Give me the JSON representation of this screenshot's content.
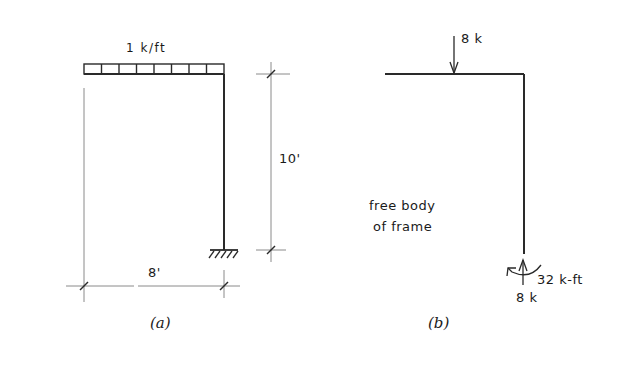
{
  "figure_a": {
    "caption": "(a)",
    "distributed_load_label": "1 k/ft",
    "height_dimension_label": "10'",
    "span_dimension_label": "8'",
    "support": "fixed",
    "load_segments": 8
  },
  "figure_b": {
    "caption": "(b)",
    "title_line1": "free body",
    "title_line2": "of frame",
    "applied_load_label": "8 k",
    "reaction_force_label": "8 k",
    "reaction_moment_label": "32 k-ft"
  },
  "colors": {
    "line": "#2a2a2a",
    "dimension_line": "#8a8a8a",
    "background": "#ffffff"
  }
}
